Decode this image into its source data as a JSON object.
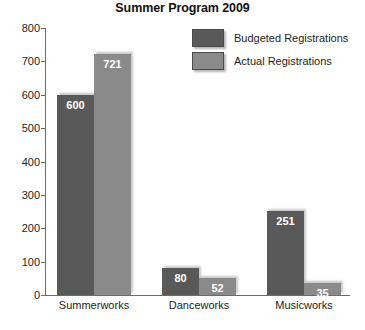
{
  "chart_data": {
    "type": "bar",
    "title": "Summer Program 2009",
    "xlabel": "",
    "ylabel": "",
    "categories": [
      "Summerworks",
      "Danceworks",
      "Musicworks"
    ],
    "series": [
      {
        "name": "Budgeted Registrations",
        "color": "#595959",
        "values": [
          600,
          80,
          251
        ]
      },
      {
        "name": "Actual Registrations",
        "color": "#8a8a8a",
        "values": [
          721,
          52,
          35
        ]
      }
    ],
    "ylim": [
      0,
      800
    ],
    "yticks": [
      0,
      100,
      200,
      300,
      400,
      500,
      600,
      700,
      800
    ],
    "ytick_labels": [
      "0",
      "100",
      "200",
      "300",
      "400",
      "500",
      "600",
      "700",
      "800"
    ],
    "grid": false,
    "legend_position": "top-right",
    "data_labels": {
      "Summerworks": {
        "budgeted": "600",
        "actual": "721"
      },
      "Danceworks": {
        "budgeted": "80",
        "actual": "52"
      },
      "Musicworks": {
        "budgeted": "251",
        "actual": "35"
      }
    },
    "background_color": "#ffffff",
    "axis_color": "#6b6b6b"
  }
}
